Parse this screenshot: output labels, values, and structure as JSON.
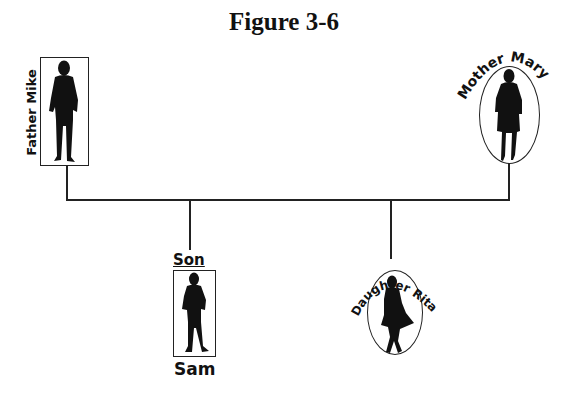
{
  "title": "Figure 3-6",
  "diagram": {
    "type": "family-tree",
    "members": [
      {
        "id": "father",
        "role": "Father",
        "name": "Mike",
        "label": "Father Mike",
        "frame": "rectangle",
        "gender": "male"
      },
      {
        "id": "mother",
        "role": "Mother",
        "name": "Mary",
        "label": "Mother Mary",
        "frame": "oval",
        "gender": "female"
      },
      {
        "id": "son",
        "role": "Son",
        "name": "Sam",
        "label_top": "Son",
        "label_bottom": "Sam",
        "frame": "rectangle",
        "gender": "male"
      },
      {
        "id": "daughter",
        "role": "Daughter",
        "name": "Rita",
        "label": "Daughter Rita",
        "frame": "oval",
        "gender": "female"
      }
    ],
    "relations": [
      {
        "type": "marriage",
        "between": [
          "father",
          "mother"
        ]
      },
      {
        "type": "child",
        "parents": [
          "father",
          "mother"
        ],
        "child": "son"
      },
      {
        "type": "child",
        "parents": [
          "father",
          "mother"
        ],
        "child": "daughter"
      }
    ]
  },
  "labels": {
    "father": "Father Mike",
    "mother": "Mother Mary",
    "son_top": "Son",
    "son_bottom": "Sam",
    "daughter": "Daughter Rita"
  },
  "colors": {
    "ink": "#111111",
    "background": "#ffffff"
  }
}
